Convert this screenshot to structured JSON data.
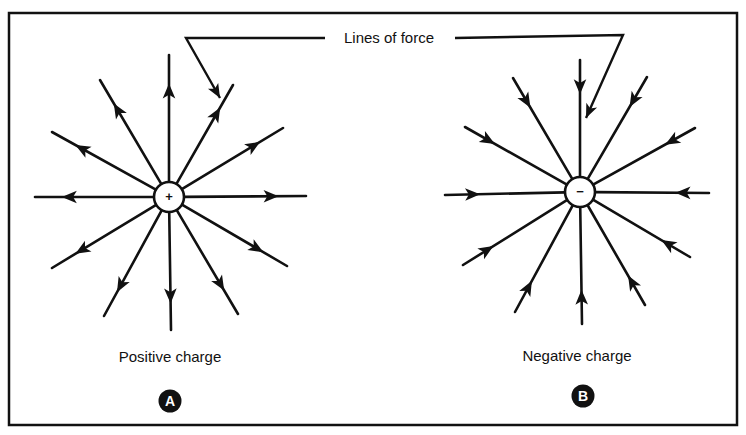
{
  "figure": {
    "title": "Lines of force",
    "frame": {
      "x1": 9,
      "y1": 13,
      "x2": 737,
      "y2": 425
    },
    "colors": {
      "ink": "#111111",
      "background": "#ffffff"
    },
    "pointers": {
      "left": {
        "from": [
          325,
          38
        ],
        "corner": [
          186,
          38
        ],
        "tip": [
          220,
          98
        ]
      },
      "right": {
        "from": [
          455,
          38
        ],
        "corner": [
          623,
          35
        ],
        "tip": [
          586,
          118
        ]
      }
    },
    "panels": [
      {
        "id": "A",
        "badge": "A",
        "caption": "Positive charge",
        "charge_symbol": "+",
        "center": [
          169,
          197
        ],
        "radius": 15,
        "direction": "outward",
        "caption_pos": [
          170,
          348
        ],
        "badge_pos": [
          170,
          401
        ],
        "lines": [
          [
            169,
            55
          ],
          [
            100,
            80
          ],
          [
            233,
            85
          ],
          [
            52,
            132
          ],
          [
            283,
            128
          ],
          [
            35,
            197
          ],
          [
            306,
            196
          ],
          [
            52,
            268
          ],
          [
            287,
            266
          ],
          [
            104,
            316
          ],
          [
            171,
            330
          ],
          [
            238,
            314
          ]
        ]
      },
      {
        "id": "B",
        "badge": "B",
        "caption": "Negative charge",
        "charge_symbol": "−",
        "center": [
          580,
          192
        ],
        "radius": 15,
        "direction": "inward",
        "caption_pos": [
          577,
          347
        ],
        "badge_pos": [
          583,
          396
        ],
        "lines": [
          [
            580,
            60
          ],
          [
            513,
            78
          ],
          [
            647,
            77
          ],
          [
            465,
            127
          ],
          [
            695,
            128
          ],
          [
            445,
            195
          ],
          [
            709,
            193
          ],
          [
            463,
            265
          ],
          [
            690,
            257
          ],
          [
            515,
            312
          ],
          [
            582,
            324
          ],
          [
            645,
            305
          ]
        ]
      }
    ]
  }
}
